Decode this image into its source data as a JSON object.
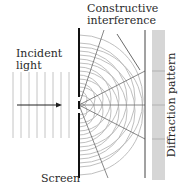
{
  "diagram": {
    "labels": {
      "constructive_line1": "Constructive",
      "constructive_line2": "interference",
      "incident_line1": "Incident",
      "incident_line2": "light",
      "screen": "Screen",
      "pattern": "Diffraction pattern"
    },
    "colors": {
      "screen": "#111111",
      "waves": "#b8b8b8",
      "rays": "#555555",
      "pattern_strip": "#d6d6d6",
      "detector_line": "#444444"
    },
    "geometry": {
      "screen_x": 79,
      "screen_top": 28,
      "screen_bottom": 178,
      "slit_top_y": 99,
      "slit_bottom_y": 111,
      "detector_x": 145,
      "pattern_x": 152,
      "pattern_width": 13,
      "incident_wave_x": [
        13,
        21,
        29,
        37,
        45,
        53,
        61,
        69
      ],
      "arc_radii": [
        8,
        16,
        24,
        32,
        40,
        48,
        56,
        64
      ]
    }
  }
}
